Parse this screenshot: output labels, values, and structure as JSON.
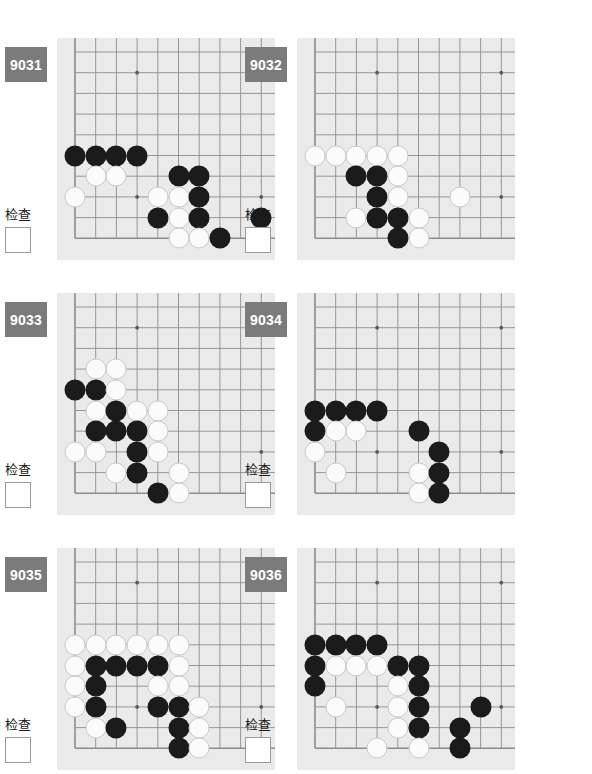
{
  "page": {
    "background": "#ffffff",
    "board_color": "#eaeaea",
    "badge_color": "#7b7b7b",
    "black_color": "#1b1b1b",
    "white_color": "#fbfbfb",
    "check_label": "检查",
    "checkbox_value": ""
  },
  "board_geometry": {
    "cols": 10,
    "rows": 10,
    "spacing": 20.7,
    "origin_x": 18,
    "origin_y": 14,
    "star_points": [
      [
        3,
        1
      ],
      [
        9,
        1
      ],
      [
        3,
        7
      ],
      [
        9,
        7
      ]
    ],
    "edge_left": true,
    "edge_bottom": true,
    "edge_top": false,
    "edge_right": false
  },
  "problems": [
    {
      "id": "9031",
      "check_label": "检查",
      "stones": [
        {
          "c": 0,
          "r": 5,
          "color": "b"
        },
        {
          "c": 1,
          "r": 5,
          "color": "b"
        },
        {
          "c": 2,
          "r": 5,
          "color": "b"
        },
        {
          "c": 3,
          "r": 5,
          "color": "b"
        },
        {
          "c": 1,
          "r": 6,
          "color": "w"
        },
        {
          "c": 2,
          "r": 6,
          "color": "w"
        },
        {
          "c": 5,
          "r": 6,
          "color": "b"
        },
        {
          "c": 6,
          "r": 6,
          "color": "b"
        },
        {
          "c": 0,
          "r": 7,
          "color": "w"
        },
        {
          "c": 4,
          "r": 7,
          "color": "w"
        },
        {
          "c": 5,
          "r": 7,
          "color": "w"
        },
        {
          "c": 6,
          "r": 7,
          "color": "b"
        },
        {
          "c": 4,
          "r": 8,
          "color": "b"
        },
        {
          "c": 5,
          "r": 8,
          "color": "w"
        },
        {
          "c": 6,
          "r": 8,
          "color": "b"
        },
        {
          "c": 9,
          "r": 8,
          "color": "b"
        },
        {
          "c": 5,
          "r": 9,
          "color": "w"
        },
        {
          "c": 6,
          "r": 9,
          "color": "w"
        },
        {
          "c": 7,
          "r": 9,
          "color": "b"
        }
      ]
    },
    {
      "id": "9032",
      "check_label": "检查",
      "stones": [
        {
          "c": 0,
          "r": 5,
          "color": "w"
        },
        {
          "c": 1,
          "r": 5,
          "color": "w"
        },
        {
          "c": 2,
          "r": 5,
          "color": "w"
        },
        {
          "c": 3,
          "r": 5,
          "color": "w"
        },
        {
          "c": 4,
          "r": 5,
          "color": "w"
        },
        {
          "c": 2,
          "r": 6,
          "color": "b"
        },
        {
          "c": 3,
          "r": 6,
          "color": "b"
        },
        {
          "c": 4,
          "r": 6,
          "color": "w"
        },
        {
          "c": 3,
          "r": 7,
          "color": "b"
        },
        {
          "c": 4,
          "r": 7,
          "color": "w"
        },
        {
          "c": 7,
          "r": 7,
          "color": "w"
        },
        {
          "c": 2,
          "r": 8,
          "color": "w"
        },
        {
          "c": 3,
          "r": 8,
          "color": "b"
        },
        {
          "c": 4,
          "r": 8,
          "color": "b"
        },
        {
          "c": 5,
          "r": 8,
          "color": "w"
        },
        {
          "c": 4,
          "r": 9,
          "color": "b"
        },
        {
          "c": 5,
          "r": 9,
          "color": "w"
        }
      ]
    },
    {
      "id": "9033",
      "check_label": "检查",
      "stones": [
        {
          "c": 1,
          "r": 3,
          "color": "w"
        },
        {
          "c": 2,
          "r": 3,
          "color": "w"
        },
        {
          "c": 0,
          "r": 4,
          "color": "b"
        },
        {
          "c": 1,
          "r": 4,
          "color": "b"
        },
        {
          "c": 2,
          "r": 4,
          "color": "w"
        },
        {
          "c": 1,
          "r": 5,
          "color": "w"
        },
        {
          "c": 2,
          "r": 5,
          "color": "b"
        },
        {
          "c": 3,
          "r": 5,
          "color": "w"
        },
        {
          "c": 4,
          "r": 5,
          "color": "w"
        },
        {
          "c": 1,
          "r": 6,
          "color": "b"
        },
        {
          "c": 2,
          "r": 6,
          "color": "b"
        },
        {
          "c": 3,
          "r": 6,
          "color": "b"
        },
        {
          "c": 4,
          "r": 6,
          "color": "w"
        },
        {
          "c": 0,
          "r": 7,
          "color": "w"
        },
        {
          "c": 1,
          "r": 7,
          "color": "w"
        },
        {
          "c": 3,
          "r": 7,
          "color": "b"
        },
        {
          "c": 4,
          "r": 7,
          "color": "w"
        },
        {
          "c": 2,
          "r": 8,
          "color": "w"
        },
        {
          "c": 3,
          "r": 8,
          "color": "b"
        },
        {
          "c": 5,
          "r": 8,
          "color": "w"
        },
        {
          "c": 4,
          "r": 9,
          "color": "b"
        },
        {
          "c": 5,
          "r": 9,
          "color": "w"
        }
      ]
    },
    {
      "id": "9034",
      "check_label": "检查",
      "stones": [
        {
          "c": 0,
          "r": 5,
          "color": "b"
        },
        {
          "c": 1,
          "r": 5,
          "color": "b"
        },
        {
          "c": 2,
          "r": 5,
          "color": "b"
        },
        {
          "c": 3,
          "r": 5,
          "color": "b"
        },
        {
          "c": 0,
          "r": 6,
          "color": "b"
        },
        {
          "c": 1,
          "r": 6,
          "color": "w"
        },
        {
          "c": 2,
          "r": 6,
          "color": "w"
        },
        {
          "c": 5,
          "r": 6,
          "color": "b"
        },
        {
          "c": 0,
          "r": 7,
          "color": "w"
        },
        {
          "c": 6,
          "r": 7,
          "color": "b"
        },
        {
          "c": 1,
          "r": 8,
          "color": "w"
        },
        {
          "c": 5,
          "r": 8,
          "color": "w"
        },
        {
          "c": 6,
          "r": 8,
          "color": "b"
        },
        {
          "c": 5,
          "r": 9,
          "color": "w"
        },
        {
          "c": 6,
          "r": 9,
          "color": "b"
        }
      ]
    },
    {
      "id": "9035",
      "check_label": "检查",
      "stones": [
        {
          "c": 0,
          "r": 4,
          "color": "w"
        },
        {
          "c": 1,
          "r": 4,
          "color": "w"
        },
        {
          "c": 2,
          "r": 4,
          "color": "w"
        },
        {
          "c": 3,
          "r": 4,
          "color": "w"
        },
        {
          "c": 4,
          "r": 4,
          "color": "w"
        },
        {
          "c": 5,
          "r": 4,
          "color": "w"
        },
        {
          "c": 0,
          "r": 5,
          "color": "w"
        },
        {
          "c": 1,
          "r": 5,
          "color": "b"
        },
        {
          "c": 2,
          "r": 5,
          "color": "b"
        },
        {
          "c": 3,
          "r": 5,
          "color": "b"
        },
        {
          "c": 4,
          "r": 5,
          "color": "b"
        },
        {
          "c": 5,
          "r": 5,
          "color": "w"
        },
        {
          "c": 0,
          "r": 6,
          "color": "w"
        },
        {
          "c": 1,
          "r": 6,
          "color": "b"
        },
        {
          "c": 4,
          "r": 6,
          "color": "w"
        },
        {
          "c": 5,
          "r": 6,
          "color": "w"
        },
        {
          "c": 0,
          "r": 7,
          "color": "w"
        },
        {
          "c": 1,
          "r": 7,
          "color": "b"
        },
        {
          "c": 4,
          "r": 7,
          "color": "b"
        },
        {
          "c": 5,
          "r": 7,
          "color": "b"
        },
        {
          "c": 6,
          "r": 7,
          "color": "w"
        },
        {
          "c": 1,
          "r": 8,
          "color": "w"
        },
        {
          "c": 2,
          "r": 8,
          "color": "b"
        },
        {
          "c": 5,
          "r": 8,
          "color": "b"
        },
        {
          "c": 6,
          "r": 8,
          "color": "w"
        },
        {
          "c": 5,
          "r": 9,
          "color": "b"
        },
        {
          "c": 6,
          "r": 9,
          "color": "w"
        }
      ]
    },
    {
      "id": "9036",
      "check_label": "检查",
      "stones": [
        {
          "c": 0,
          "r": 4,
          "color": "b"
        },
        {
          "c": 1,
          "r": 4,
          "color": "b"
        },
        {
          "c": 2,
          "r": 4,
          "color": "b"
        },
        {
          "c": 3,
          "r": 4,
          "color": "b"
        },
        {
          "c": 0,
          "r": 5,
          "color": "b"
        },
        {
          "c": 1,
          "r": 5,
          "color": "w"
        },
        {
          "c": 2,
          "r": 5,
          "color": "w"
        },
        {
          "c": 3,
          "r": 5,
          "color": "w"
        },
        {
          "c": 4,
          "r": 5,
          "color": "b"
        },
        {
          "c": 5,
          "r": 5,
          "color": "b"
        },
        {
          "c": 0,
          "r": 6,
          "color": "b"
        },
        {
          "c": 4,
          "r": 6,
          "color": "w"
        },
        {
          "c": 5,
          "r": 6,
          "color": "b"
        },
        {
          "c": 1,
          "r": 7,
          "color": "w"
        },
        {
          "c": 4,
          "r": 7,
          "color": "w"
        },
        {
          "c": 5,
          "r": 7,
          "color": "b"
        },
        {
          "c": 8,
          "r": 7,
          "color": "b"
        },
        {
          "c": 4,
          "r": 8,
          "color": "w"
        },
        {
          "c": 5,
          "r": 8,
          "color": "b"
        },
        {
          "c": 7,
          "r": 8,
          "color": "b"
        },
        {
          "c": 3,
          "r": 9,
          "color": "w"
        },
        {
          "c": 5,
          "r": 9,
          "color": "w"
        },
        {
          "c": 7,
          "r": 9,
          "color": "b"
        }
      ]
    }
  ]
}
